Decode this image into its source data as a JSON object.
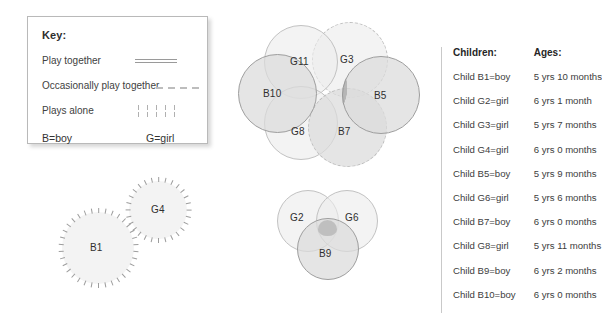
{
  "key": {
    "title": "Key:",
    "rows": [
      {
        "label": "Play together",
        "marker": "solid-line"
      },
      {
        "label": "Occasionally play together",
        "marker": "dashed-line"
      },
      {
        "label": "Plays alone",
        "marker": "tick-marks"
      }
    ],
    "boy_legend": "B=boy",
    "girl_legend": "G=girl"
  },
  "clusters": {
    "top": {
      "name": "five-child-cluster",
      "circles": [
        {
          "label": "G11",
          "style": "solid-thin",
          "fill": "light"
        },
        {
          "label": "G3",
          "style": "dashed",
          "fill": "light"
        },
        {
          "label": "B10",
          "style": "solid",
          "fill": "mid"
        },
        {
          "label": "B5",
          "style": "solid",
          "fill": "mid"
        },
        {
          "label": "G8",
          "style": "solid-thin",
          "fill": "light"
        },
        {
          "label": "B7",
          "style": "dashed",
          "fill": "mid"
        }
      ]
    },
    "lower_left": {
      "name": "plays-alone-cluster",
      "circles": [
        {
          "label": "B1",
          "style": "tick-ring",
          "fill": "light"
        },
        {
          "label": "G4",
          "style": "tick-ring",
          "fill": "light"
        }
      ]
    },
    "lower_middle": {
      "name": "three-child-cluster",
      "circles": [
        {
          "label": "G2",
          "style": "solid-thin",
          "fill": "light"
        },
        {
          "label": "G6",
          "style": "solid-thin",
          "fill": "light"
        },
        {
          "label": "B9",
          "style": "solid",
          "fill": "mid"
        }
      ]
    }
  },
  "table": {
    "headers": {
      "children": "Children:",
      "ages": "Ages:"
    },
    "rows": [
      {
        "child": "Child B1=boy",
        "age": "5 yrs 10 months"
      },
      {
        "child": "Child G2=girl",
        "age": "6 yrs 1 month"
      },
      {
        "child": "Child G3=girl",
        "age": "5 yrs 7 months"
      },
      {
        "child": "Child G4=girl",
        "age": "6 yrs 0 months"
      },
      {
        "child": "Child B5=boy",
        "age": "5 yrs 9 months"
      },
      {
        "child": "Child G6=girl",
        "age": "5 yrs 6 months"
      },
      {
        "child": "Child B7=boy",
        "age": "6 yrs 0 months"
      },
      {
        "child": "Child G8=girl",
        "age": "5 yrs 11 months"
      },
      {
        "child": "Child B9=boy",
        "age": "6 yrs 2 months"
      },
      {
        "child": "Child B10=boy",
        "age": "6 yrs 0 months"
      }
    ]
  },
  "colors": {
    "circle_light": "#ebebeb",
    "circle_mid": "#dbdbdb",
    "circle_dark": "#cdcdcd",
    "stroke": "#9e9e9e",
    "stroke_light": "#c2c2c2",
    "text": "#3a3a3a",
    "panel_border": "#b9b9b9"
  }
}
